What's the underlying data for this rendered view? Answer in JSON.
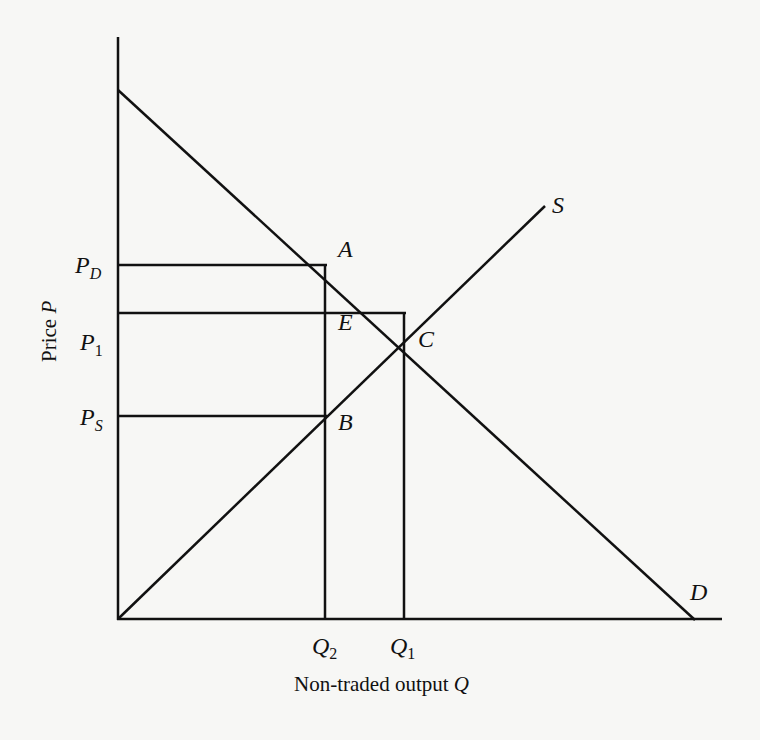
{
  "diagram": {
    "axes": {
      "x_label_text": "Non-traded output ",
      "x_label_var": "Q",
      "y_label_text": "Price ",
      "y_label_var": "P"
    },
    "curves": {
      "demand": "D",
      "supply": "S"
    },
    "points": {
      "A": "A",
      "B": "B",
      "C": "C",
      "E": "E"
    },
    "price_ticks": {
      "PD_main": "P",
      "PD_sub": "D",
      "P1_main": "P",
      "P1_sub": "1",
      "PS_main": "P",
      "PS_sub": "S"
    },
    "quantity_ticks": {
      "Q2_main": "Q",
      "Q2_sub": "2",
      "Q1_main": "Q",
      "Q1_sub": "1"
    }
  },
  "colors": {
    "background": "#f7f7f5",
    "line": "#111111"
  }
}
